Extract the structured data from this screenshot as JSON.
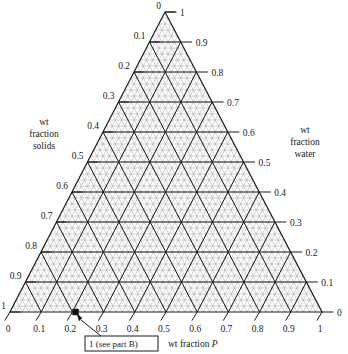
{
  "chart_data": {
    "type": "scatter",
    "plot_kind": "ternary-diagram",
    "title": "",
    "axes": [
      {
        "name": "wt fraction P",
        "position": "bottom",
        "label": "wt fraction P",
        "label_italic_tail": "P",
        "direction": "left-to-right",
        "ticks": [
          "0",
          "0.1",
          "0.2",
          "0.3",
          "0.4",
          "0.5",
          "0.6",
          "0.7",
          "0.8",
          "0.9",
          "1"
        ],
        "range": [
          0,
          1
        ]
      },
      {
        "name": "wt fraction solids",
        "position": "left",
        "label": "wt fraction solids",
        "label_lines": [
          "wt",
          "fraction",
          "solids"
        ],
        "direction": "apex-to-bottom-left",
        "ticks": [
          "0",
          "0.1",
          "0.2",
          "0.3",
          "0.4",
          "0.5",
          "0.6",
          "0.7",
          "0.8",
          "0.9",
          "1"
        ],
        "range": [
          0,
          1
        ]
      },
      {
        "name": "wt fraction water",
        "position": "right",
        "label": "wt fraction water",
        "label_lines": [
          "wt",
          "fraction",
          "water"
        ],
        "direction": "bottom-right-to-apex",
        "ticks": [
          "0",
          "0.1",
          "0.2",
          "0.3",
          "0.4",
          "0.5",
          "0.6",
          "0.7",
          "0.8",
          "0.9",
          "1"
        ],
        "range": [
          0,
          1
        ]
      }
    ],
    "grid": {
      "major_step": 0.1,
      "minor_step": 0.02,
      "on": true,
      "style": "triangular-mesh"
    },
    "points": [
      {
        "label": "1 (see part B)",
        "p": 0.21,
        "solids": 0.0,
        "water": 0.79,
        "marker": "filled-square"
      }
    ],
    "annotations": [
      {
        "id": "callout-1",
        "text": "1 (see part B)",
        "boxed": true,
        "leader_to_point": "1 (see part B)"
      }
    ],
    "colors": {
      "line": "#1a1a1a",
      "mesh": "#9a9a9a",
      "background": "#ffffff",
      "marker": "#111111"
    }
  },
  "labels": {
    "bottom_axis_title_prefix": "wt fraction ",
    "bottom_axis_title_variable": "P",
    "left_axis_title_line1": "wt",
    "left_axis_title_line2": "fraction",
    "left_axis_title_line3": "solids",
    "right_axis_title_line1": "wt",
    "right_axis_title_line2": "fraction",
    "right_axis_title_line3": "water",
    "callout": "1 (see part B)"
  },
  "bottom_ticks": [
    "0",
    "0.1",
    "0.2",
    "0.3",
    "0.4",
    "0.5",
    "0.6",
    "0.7",
    "0.8",
    "0.9",
    "1"
  ],
  "left_ticks": [
    "0",
    "0.1",
    "0.2",
    "0.3",
    "0.4",
    "0.5",
    "0.6",
    "0.7",
    "0.8",
    "0.9",
    "1"
  ],
  "right_ticks": [
    "1",
    "0.9",
    "0.8",
    "0.7",
    "0.6",
    "0.5",
    "0.4",
    "0.3",
    "0.2",
    "0.1",
    "0"
  ]
}
